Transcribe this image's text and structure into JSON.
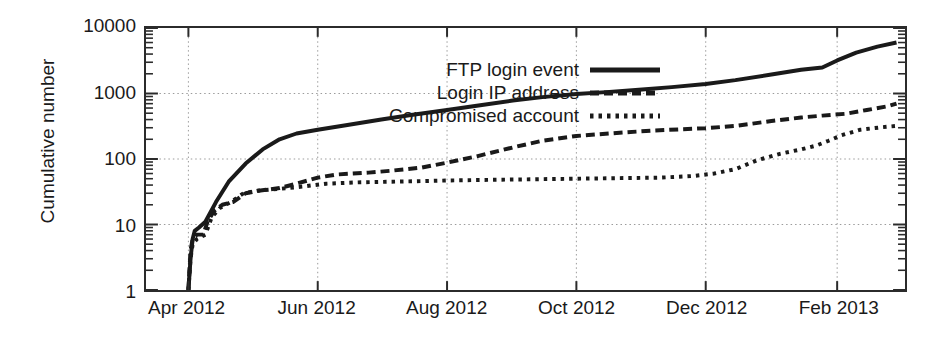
{
  "chart_data": {
    "type": "line",
    "title": "",
    "xlabel": "",
    "ylabel": "Cumulative number",
    "yscale": "log",
    "ylim": [
      1,
      10000
    ],
    "y_ticks": [
      "10000",
      "1000",
      "100",
      "10",
      "1"
    ],
    "y_tick_values": [
      10000,
      1000,
      100,
      10,
      1
    ],
    "x_ticks": [
      "Apr 2012",
      "Jun 2012",
      "Aug 2012",
      "Oct 2012",
      "Dec 2012",
      "Feb 2013"
    ],
    "xlim": [
      "2012-03-12",
      "2013-03-05"
    ],
    "grid": "dotted gridlines at major x and y ticks",
    "legend_position": "top-center-left",
    "minor_ticks": "log minor ticks on left and right axes",
    "series": [
      {
        "name": "FTP login event",
        "style": "solid",
        "linewidth": 4,
        "color": "#1a1a1a",
        "points": [
          [
            "2012-04-01",
            1
          ],
          [
            "2012-04-02",
            3
          ],
          [
            "2012-04-03",
            6
          ],
          [
            "2012-04-04",
            8
          ],
          [
            "2012-04-06",
            9
          ],
          [
            "2012-04-09",
            11
          ],
          [
            "2012-04-14",
            22
          ],
          [
            "2012-04-20",
            45
          ],
          [
            "2012-04-28",
            85
          ],
          [
            "2012-05-06",
            140
          ],
          [
            "2012-05-14",
            200
          ],
          [
            "2012-05-22",
            245
          ],
          [
            "2012-06-01",
            280
          ],
          [
            "2012-06-15",
            330
          ],
          [
            "2012-07-01",
            400
          ],
          [
            "2012-07-15",
            470
          ],
          [
            "2012-08-01",
            560
          ],
          [
            "2012-08-15",
            650
          ],
          [
            "2012-09-01",
            780
          ],
          [
            "2012-09-15",
            880
          ],
          [
            "2012-10-01",
            980
          ],
          [
            "2012-10-15",
            1050
          ],
          [
            "2012-11-01",
            1150
          ],
          [
            "2012-11-15",
            1250
          ],
          [
            "2012-12-01",
            1400
          ],
          [
            "2012-12-15",
            1600
          ],
          [
            "2013-01-01",
            1950
          ],
          [
            "2013-01-15",
            2300
          ],
          [
            "2013-01-25",
            2500
          ],
          [
            "2013-02-01",
            3200
          ],
          [
            "2013-02-10",
            4200
          ],
          [
            "2013-02-20",
            5200
          ],
          [
            "2013-03-01",
            6000
          ]
        ]
      },
      {
        "name": "Login IP address",
        "style": "dashed",
        "linewidth": 4,
        "color": "#1a1a1a",
        "points": [
          [
            "2012-04-01",
            1
          ],
          [
            "2012-04-02",
            4
          ],
          [
            "2012-04-03",
            6
          ],
          [
            "2012-04-05",
            7
          ],
          [
            "2012-04-08",
            7
          ],
          [
            "2012-04-10",
            11
          ],
          [
            "2012-04-13",
            16
          ],
          [
            "2012-04-17",
            20
          ],
          [
            "2012-04-22",
            22
          ],
          [
            "2012-04-28",
            30
          ],
          [
            "2012-05-05",
            33
          ],
          [
            "2012-05-14",
            36
          ],
          [
            "2012-05-22",
            42
          ],
          [
            "2012-06-01",
            52
          ],
          [
            "2012-06-10",
            58
          ],
          [
            "2012-06-25",
            62
          ],
          [
            "2012-07-05",
            66
          ],
          [
            "2012-07-20",
            74
          ],
          [
            "2012-08-01",
            88
          ],
          [
            "2012-08-15",
            110
          ],
          [
            "2012-09-01",
            150
          ],
          [
            "2012-09-15",
            190
          ],
          [
            "2012-10-01",
            225
          ],
          [
            "2012-10-20",
            250
          ],
          [
            "2012-11-05",
            270
          ],
          [
            "2012-11-20",
            285
          ],
          [
            "2012-12-01",
            295
          ],
          [
            "2012-12-15",
            320
          ],
          [
            "2013-01-01",
            380
          ],
          [
            "2013-01-15",
            430
          ],
          [
            "2013-01-25",
            460
          ],
          [
            "2013-02-05",
            490
          ],
          [
            "2013-02-15",
            560
          ],
          [
            "2013-02-25",
            640
          ],
          [
            "2013-03-01",
            700
          ]
        ]
      },
      {
        "name": "Compromised account",
        "style": "dotted",
        "linewidth": 4,
        "color": "#1a1a1a",
        "points": [
          [
            "2012-04-01",
            1
          ],
          [
            "2012-04-02",
            3
          ],
          [
            "2012-04-03",
            5
          ],
          [
            "2012-04-05",
            6
          ],
          [
            "2012-04-09",
            7
          ],
          [
            "2012-04-12",
            13
          ],
          [
            "2012-04-16",
            18
          ],
          [
            "2012-04-21",
            22
          ],
          [
            "2012-04-27",
            30
          ],
          [
            "2012-05-04",
            33
          ],
          [
            "2012-05-14",
            35
          ],
          [
            "2012-05-25",
            38
          ],
          [
            "2012-06-05",
            42
          ],
          [
            "2012-06-20",
            44
          ],
          [
            "2012-07-05",
            45
          ],
          [
            "2012-07-20",
            46
          ],
          [
            "2012-08-01",
            47
          ],
          [
            "2012-08-20",
            48
          ],
          [
            "2012-09-10",
            49
          ],
          [
            "2012-10-01",
            50
          ],
          [
            "2012-10-20",
            51
          ],
          [
            "2012-11-10",
            52
          ],
          [
            "2012-11-25",
            55
          ],
          [
            "2012-12-05",
            60
          ],
          [
            "2012-12-15",
            70
          ],
          [
            "2012-12-25",
            95
          ],
          [
            "2013-01-05",
            120
          ],
          [
            "2013-01-15",
            140
          ],
          [
            "2013-01-22",
            160
          ],
          [
            "2013-01-28",
            190
          ],
          [
            "2013-02-03",
            230
          ],
          [
            "2013-02-12",
            280
          ],
          [
            "2013-02-22",
            305
          ],
          [
            "2013-03-01",
            320
          ]
        ]
      }
    ]
  }
}
